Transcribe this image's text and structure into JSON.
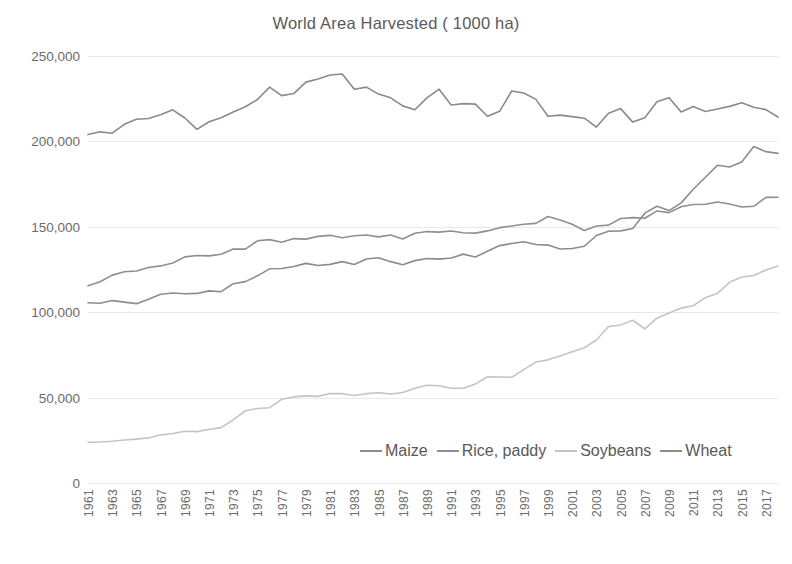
{
  "chart_data": {
    "type": "line",
    "title": "World Area Harvested ( 1000 ha)",
    "xlabel": "",
    "ylabel": "",
    "ylim": [
      0,
      250000
    ],
    "yticks": [
      0,
      50000,
      100000,
      150000,
      200000,
      250000
    ],
    "ytick_labels": [
      "0",
      "50,000",
      "100,000",
      "150,000",
      "200,000",
      "250,000"
    ],
    "grid": true,
    "legend_position": "inside-bottom-center",
    "x": [
      1961,
      1962,
      1963,
      1964,
      1965,
      1966,
      1967,
      1968,
      1969,
      1970,
      1971,
      1972,
      1973,
      1974,
      1975,
      1976,
      1977,
      1978,
      1979,
      1980,
      1981,
      1982,
      1983,
      1984,
      1985,
      1986,
      1987,
      1988,
      1989,
      1990,
      1991,
      1992,
      1993,
      1994,
      1995,
      1996,
      1997,
      1998,
      1999,
      2000,
      2001,
      2002,
      2003,
      2004,
      2005,
      2006,
      2007,
      2008,
      2009,
      2010,
      2011,
      2012,
      2013,
      2014,
      2015,
      2016,
      2017,
      2018
    ],
    "xtick_labels": [
      "1961",
      "1963",
      "1965",
      "1967",
      "1969",
      "1971",
      "1973",
      "1975",
      "1977",
      "1979",
      "1981",
      "1983",
      "1985",
      "1987",
      "1989",
      "1991",
      "1993",
      "1995",
      "1997",
      "1999",
      "2001",
      "2003",
      "2005",
      "2007",
      "2009",
      "2011",
      "2013",
      "2015",
      "2017"
    ],
    "series": [
      {
        "name": "Maize",
        "color": "#8c8c8c",
        "values": [
          105500,
          105200,
          106800,
          105900,
          105000,
          107600,
          110500,
          111200,
          110800,
          111000,
          112500,
          112000,
          116700,
          117900,
          121300,
          125400,
          125600,
          126800,
          128600,
          127300,
          128000,
          129600,
          127900,
          131100,
          131900,
          129600,
          127800,
          130200,
          131400,
          131100,
          131700,
          134000,
          132300,
          135700,
          139000,
          140200,
          141200,
          139600,
          139300,
          137000,
          137300,
          138600,
          144900,
          147400,
          147600,
          149000,
          158000,
          162000,
          159500,
          164000,
          172000,
          179000,
          186000,
          185000,
          188000,
          197000,
          194000,
          193000
        ]
      },
      {
        "name": "Rice, paddy",
        "color": "#8f8f8f",
        "values": [
          115500,
          117800,
          121700,
          123700,
          124100,
          126200,
          127100,
          128800,
          132400,
          133200,
          133000,
          133900,
          137000,
          136900,
          141800,
          142500,
          141000,
          143100,
          142800,
          144400,
          145000,
          143600,
          144800,
          145200,
          144100,
          145200,
          142900,
          146200,
          147200,
          146900,
          147500,
          146500,
          146300,
          147600,
          149500,
          150500,
          151500,
          152000,
          156000,
          154000,
          151500,
          147800,
          150500,
          151000,
          154900,
          155400,
          155000,
          159300,
          158300,
          161700,
          163100,
          163200,
          164500,
          163300,
          161600,
          162000,
          167200,
          167300
        ]
      },
      {
        "name": "Soybeans",
        "color": "#c4c4c4",
        "values": [
          23800,
          24000,
          24400,
          25200,
          25700,
          26400,
          28200,
          29000,
          30300,
          30100,
          31300,
          32400,
          37000,
          42300,
          43600,
          44100,
          49000,
          50400,
          51000,
          50700,
          52400,
          52300,
          51200,
          52300,
          52800,
          52100,
          53000,
          55500,
          57200,
          56900,
          55500,
          55500,
          57900,
          62200,
          62100,
          61900,
          66400,
          70800,
          72100,
          74400,
          76800,
          79200,
          83700,
          91600,
          92500,
          95300,
          90200,
          96500,
          99500,
          102400,
          103800,
          108500,
          111100,
          117500,
          120600,
          121500,
          124700,
          127000
        ]
      },
      {
        "name": "Wheat",
        "color": "#8a8a8a",
        "values": [
          204000,
          205600,
          204800,
          210000,
          213000,
          213400,
          215600,
          218500,
          213700,
          207000,
          211500,
          213900,
          217200,
          220300,
          224500,
          231800,
          226800,
          228000,
          234700,
          236500,
          238900,
          239500,
          230500,
          231800,
          227700,
          225500,
          220800,
          218500,
          225500,
          230600,
          221300,
          222100,
          221800,
          214700,
          217600,
          229500,
          228300,
          224600,
          214700,
          215400,
          214500,
          213600,
          208400,
          216500,
          219200,
          211300,
          213900,
          223200,
          225600,
          217200,
          220400,
          217500,
          219000,
          220500,
          222600,
          220000,
          218600,
          214300
        ]
      }
    ]
  }
}
